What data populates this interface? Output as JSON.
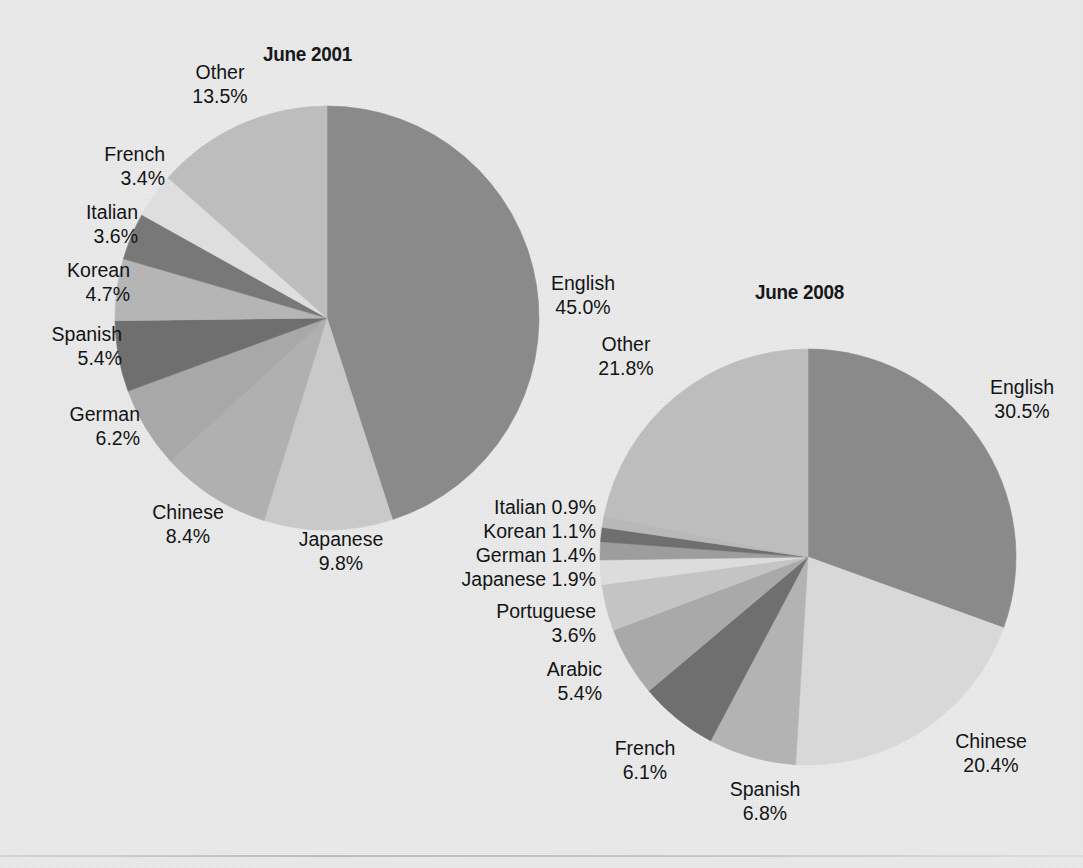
{
  "page": {
    "background_color": "#ebeceb",
    "bottom_rule_color": "#c9c9c9"
  },
  "chart_data": [
    {
      "type": "pie",
      "title": "June 2001",
      "unit": "%",
      "start_angle_deg": 0,
      "direction": "clockwise",
      "categories": [
        "English",
        "Japanese",
        "Chinese",
        "German",
        "Spanish",
        "Korean",
        "Italian",
        "French",
        "Other"
      ],
      "values": [
        45.0,
        9.8,
        8.4,
        6.2,
        5.4,
        4.7,
        3.6,
        3.4,
        13.5
      ],
      "colors": [
        "#8a8a8a",
        "#c9c9c9",
        "#b0b0b0",
        "#a8a8a8",
        "#6f6f6f",
        "#b5b5b5",
        "#787878",
        "#dedede",
        "#bdbdbd"
      ],
      "labels": [
        {
          "name": "English",
          "value": "45.0%"
        },
        {
          "name": "Japanese",
          "value": "9.8%"
        },
        {
          "name": "Chinese",
          "value": "8.4%"
        },
        {
          "name": "German",
          "value": "6.2%"
        },
        {
          "name": "Spanish",
          "value": "5.4%"
        },
        {
          "name": "Korean",
          "value": "4.7%"
        },
        {
          "name": "Italian",
          "value": "3.6%"
        },
        {
          "name": "French",
          "value": "3.4%"
        },
        {
          "name": "Other",
          "value": "13.5%"
        }
      ]
    },
    {
      "type": "pie",
      "title": "June 2008",
      "unit": "%",
      "start_angle_deg": 0,
      "direction": "clockwise",
      "categories": [
        "English",
        "Chinese",
        "Spanish",
        "French",
        "Arabic",
        "Portuguese",
        "Japanese",
        "German",
        "Korean",
        "Italian",
        "Other"
      ],
      "values": [
        30.5,
        20.4,
        6.8,
        6.1,
        5.4,
        3.6,
        1.9,
        1.4,
        1.1,
        0.9,
        21.8
      ],
      "colors": [
        "#8a8a8a",
        "#d8d8d8",
        "#b3b3b3",
        "#6f6f6f",
        "#a9a9a9",
        "#c4c4c4",
        "#dcdcdc",
        "#9d9d9d",
        "#6f6f6f",
        "#b8b8b8",
        "#bdbdbd"
      ],
      "labels": [
        {
          "name": "English",
          "value": "30.5%"
        },
        {
          "name": "Chinese",
          "value": "20.4%"
        },
        {
          "name": "Spanish",
          "value": "6.8%"
        },
        {
          "name": "French",
          "value": "6.1%"
        },
        {
          "name": "Arabic",
          "value": "5.4%"
        },
        {
          "name": "Portuguese",
          "value": "3.6%"
        },
        {
          "name": "Japanese",
          "value": "1.9%"
        },
        {
          "name": "German",
          "value": "1.4%"
        },
        {
          "name": "Korean",
          "value": "1.1%"
        },
        {
          "name": "Italian",
          "value": "0.9%"
        },
        {
          "name": "Other",
          "value": "21.8%"
        }
      ]
    }
  ],
  "pie2001": {
    "title": "June 2001",
    "other_name": "Other",
    "other_value": "13.5%",
    "french_name": "French",
    "french_value": "3.4%",
    "italian_name": "Italian",
    "italian_value": "3.6%",
    "korean_name": "Korean",
    "korean_value": "4.7%",
    "spanish_name": "Spanish",
    "spanish_value": "5.4%",
    "german_name": "German",
    "german_value": "6.2%",
    "chinese_name": "Chinese",
    "chinese_value": "8.4%",
    "japanese_name": "Japanese",
    "japanese_value": "9.8%",
    "english_name": "English",
    "english_value": "45.0%"
  },
  "pie2008": {
    "title": "June 2008",
    "other_name": "Other",
    "other_value": "21.8%",
    "italian_line": "Italian 0.9%",
    "korean_line": "Korean 1.1%",
    "german_line": "German 1.4%",
    "japanese_line": "Japanese 1.9%",
    "portuguese_name": "Portuguese",
    "portuguese_value": "3.6%",
    "arabic_name": "Arabic",
    "arabic_value": "5.4%",
    "french_name": "French",
    "french_value": "6.1%",
    "spanish_name": "Spanish",
    "spanish_value": "6.8%",
    "english_name": "English",
    "english_value": "30.5%",
    "chinese_name": "Chinese",
    "chinese_value": "20.4%"
  }
}
